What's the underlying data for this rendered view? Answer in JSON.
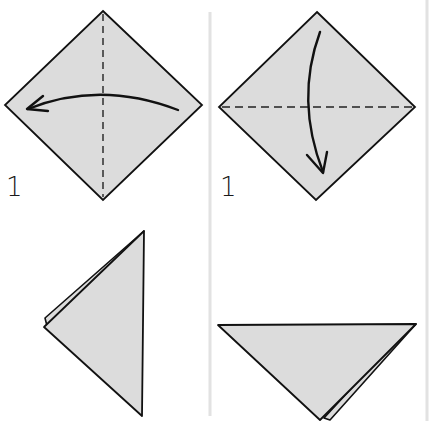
{
  "diagram": {
    "colors": {
      "paper_fill": "#dcdcdc",
      "outline": "#111111",
      "divider": "#e2e2e2",
      "background": "#ffffff"
    },
    "panels": [
      {
        "id": "panel-1",
        "step_label": "1",
        "shape": "square-diamond",
        "fold_line": "vertical-dashed",
        "arrow": "curved-right-to-left"
      },
      {
        "id": "panel-2",
        "step_label": "1",
        "shape": "square-diamond",
        "fold_line": "horizontal-dashed",
        "arrow": "curved-top-to-bottom"
      },
      {
        "id": "panel-3",
        "step_label": "",
        "shape": "folded-triangle-pointing-left",
        "fold_line": "",
        "arrow": ""
      },
      {
        "id": "panel-4",
        "step_label": "",
        "shape": "folded-triangle-pointing-down",
        "fold_line": "",
        "arrow": ""
      }
    ]
  }
}
